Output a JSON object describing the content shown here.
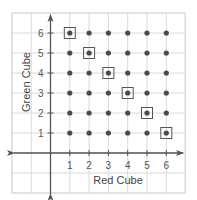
{
  "chart_data": {
    "type": "scatter",
    "title": "",
    "xlabel": "Red Cube",
    "ylabel": "Green Cube",
    "x_ticks": [
      "1",
      "2",
      "3",
      "4",
      "5",
      "6"
    ],
    "y_ticks": [
      "1",
      "2",
      "3",
      "4",
      "5",
      "6"
    ],
    "xlim": [
      -2,
      7
    ],
    "ylim": [
      -1,
      7
    ],
    "grid": true,
    "legend": null,
    "points": "all integer pairs (x,y) with x in 1..6 and y in 1..6 (36 outcomes)",
    "highlighted_points": [
      {
        "x": 1,
        "y": 6
      },
      {
        "x": 2,
        "y": 5
      },
      {
        "x": 3,
        "y": 4
      },
      {
        "x": 4,
        "y": 3
      },
      {
        "x": 5,
        "y": 2
      },
      {
        "x": 6,
        "y": 1
      }
    ],
    "highlight_style": "square outline (sum = 7)"
  },
  "colors": {
    "grid": "#d9d9d9",
    "axis": "#555555",
    "point": "#4a4a4a",
    "highlight_box": "#555555",
    "background": "#ffffff"
  }
}
